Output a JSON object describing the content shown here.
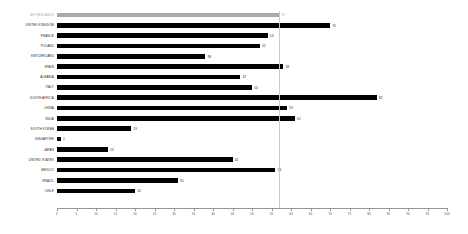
{
  "chart_data": {
    "type": "bar",
    "orientation": "horizontal",
    "title": "",
    "subtitle": "",
    "xlabel": "",
    "ylabel": "",
    "xlim": [
      0,
      100
    ],
    "grid": false,
    "legend": null,
    "highlight_category": "NETHERLANDS",
    "reference_line": {
      "value": 57,
      "orientation": "vertical",
      "color": "#c9cacc"
    },
    "colors": {
      "bar": "#000000",
      "highlight_bar": "#a7a9ac",
      "highlight_label": "#a7a9ac",
      "axis": "#939598",
      "text": "#231f20"
    },
    "xticks": [
      0,
      5,
      10,
      15,
      20,
      25,
      30,
      35,
      40,
      45,
      50,
      55,
      60,
      65,
      70,
      75,
      80,
      85,
      90,
      95,
      100
    ],
    "xticklabels": [
      "0",
      "5",
      "10",
      "15",
      "20",
      "25",
      "30",
      "35",
      "40",
      "45",
      "50",
      "55",
      "60",
      "65",
      "70",
      "75",
      "80",
      "85",
      "90",
      "95",
      "100"
    ],
    "categories": [
      "NETHERLANDS",
      "UNITED KINGDOM",
      "FRANCE",
      "POLAND",
      "SWITZERLAND",
      "SPAIN",
      "ALBANIA",
      "ITALY",
      "SOUTH AFRICA",
      "CHINA",
      "INDIA",
      "SOUTH KOREA",
      "SINGAPORE",
      "JAPAN",
      "UNITED STATES",
      "MEXICO",
      "BRAZIL",
      "CHILE"
    ],
    "values": [
      57,
      70,
      54,
      52,
      38,
      58,
      47,
      50,
      82,
      59,
      61,
      19,
      1,
      13,
      45,
      56,
      31,
      20
    ],
    "bars": [
      {
        "label": "NETHERLANDS",
        "value": 57,
        "value_text": "57",
        "highlight": true
      },
      {
        "label": "UNITED KINGDOM",
        "value": 70,
        "value_text": "70",
        "highlight": false
      },
      {
        "label": "FRANCE",
        "value": 54,
        "value_text": "54",
        "highlight": false
      },
      {
        "label": "POLAND",
        "value": 52,
        "value_text": "52",
        "highlight": false
      },
      {
        "label": "SWITZERLAND",
        "value": 38,
        "value_text": "38",
        "highlight": false
      },
      {
        "label": "SPAIN",
        "value": 58,
        "value_text": "58",
        "highlight": false
      },
      {
        "label": "ALBANIA",
        "value": 47,
        "value_text": "47",
        "highlight": false
      },
      {
        "label": "ITALY",
        "value": 50,
        "value_text": "50",
        "highlight": false
      },
      {
        "label": "SOUTH AFRICA",
        "value": 82,
        "value_text": "82",
        "highlight": false
      },
      {
        "label": "CHINA",
        "value": 59,
        "value_text": "59",
        "highlight": false
      },
      {
        "label": "INDIA",
        "value": 61,
        "value_text": "61",
        "highlight": false
      },
      {
        "label": "SOUTH KOREA",
        "value": 19,
        "value_text": "19",
        "highlight": false
      },
      {
        "label": "SINGAPORE",
        "value": 1,
        "value_text": "1",
        "highlight": false
      },
      {
        "label": "JAPAN",
        "value": 13,
        "value_text": "13",
        "highlight": false
      },
      {
        "label": "UNITED STATES",
        "value": 45,
        "value_text": "45",
        "highlight": false
      },
      {
        "label": "MEXICO",
        "value": 56,
        "value_text": "56",
        "highlight": false
      },
      {
        "label": "BRAZIL",
        "value": 31,
        "value_text": "31",
        "highlight": false
      },
      {
        "label": "CHILE",
        "value": 20,
        "value_text": "20",
        "highlight": false
      }
    ]
  }
}
